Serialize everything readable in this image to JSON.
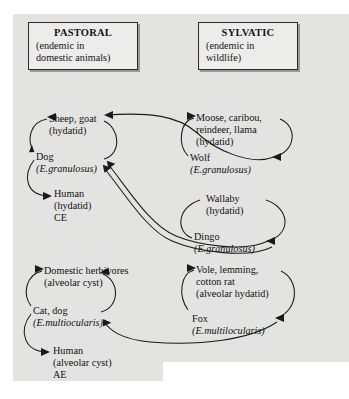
{
  "figure": {
    "type": "cycle-diagram"
  },
  "panels": {
    "pastoral": {
      "name": "pastoral-panel",
      "title_head": "PASTORAL",
      "title_sub": "(endemic in\ndomestic animals)",
      "title_sub_line1": "(endemic in",
      "title_sub_line2": "domestic animals)"
    },
    "sylvatic": {
      "name": "sylvatic-panel",
      "title_head": "SYLVATIC",
      "title_sub_line1": "(endemic in",
      "title_sub_line2": "wildlife)"
    }
  },
  "nodes": {
    "sheep": {
      "line1": "Sheep, goat",
      "line2": "(hydatid)"
    },
    "dog": {
      "line1": "Dog",
      "line2": "(E.granulosus)"
    },
    "human_ce": {
      "line1": "Human",
      "line2": "(hydatid)",
      "line3": "CE"
    },
    "domestic_herbivores": {
      "line1": "Domestic herbivores",
      "line2": "(alveolar cyst)"
    },
    "cat_dog": {
      "line1": "Cat, dog",
      "line2": "(E.multiocularis)"
    },
    "human_ae": {
      "line1": "Human",
      "line2": "(alveolar cyst)",
      "line3": "AE"
    },
    "moose": {
      "line1": "Moose, caribou,",
      "line2": "reindeer, llama",
      "line3": "(hydatid)"
    },
    "wolf": {
      "line1": "Wolf",
      "line2": "(E.granulosus)"
    },
    "wallaby": {
      "line1": "Wallaby",
      "line2": "(hydatid)"
    },
    "dingo": {
      "line1": "Dingo",
      "line2": "(E.granulosus)"
    },
    "vole": {
      "line1": "Vole, lemming,",
      "line2": "cotton rat",
      "line3": "(alveolar hydatid)"
    },
    "fox": {
      "line1": "Fox",
      "line2": "(E.multilocularis)"
    }
  },
  "colors": {
    "panel_background": "#e3e3e1",
    "page_background": "#ffffff",
    "ink": "#1a1a1a",
    "box_fill": "#ececeb"
  }
}
